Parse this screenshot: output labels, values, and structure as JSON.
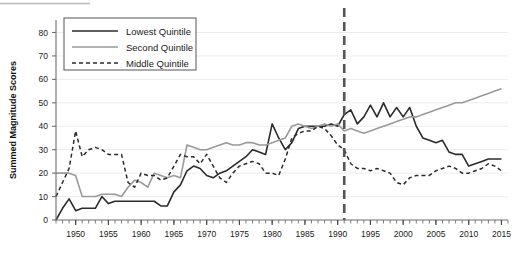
{
  "chart_data": {
    "type": "line",
    "title": "",
    "xlabel": "",
    "ylabel": "Summed Magnitude Scores",
    "xlim": [
      1947,
      2016
    ],
    "ylim": [
      0,
      85
    ],
    "grid": true,
    "grid_axis": "y",
    "legend_position": "top-left",
    "y_ticks": [
      0,
      10,
      20,
      30,
      40,
      50,
      60,
      70,
      80
    ],
    "y_tick_labels": [
      "0",
      "10",
      "20",
      "30",
      "40",
      "50",
      "60",
      "70",
      "80"
    ],
    "x_ticks": [
      1950,
      1955,
      1960,
      1965,
      1970,
      1975,
      1980,
      1985,
      1990,
      1995,
      2000,
      2005,
      2010,
      2015
    ],
    "x_tick_labels": [
      "1950",
      "1955",
      "1960",
      "1965",
      "1970",
      "1975",
      "1980",
      "1985",
      "1990",
      "1995",
      "2000",
      "2005",
      "2010",
      "2015"
    ],
    "x_minor_tick_step": 1,
    "annotations": [
      {
        "name": "vertical-reference-line",
        "type": "vline",
        "x": 1991,
        "style": "dashed",
        "color": "#555555",
        "width": 2.6
      }
    ],
    "x": [
      1947,
      1948,
      1949,
      1950,
      1951,
      1952,
      1953,
      1954,
      1955,
      1956,
      1957,
      1958,
      1959,
      1960,
      1961,
      1962,
      1963,
      1964,
      1965,
      1966,
      1967,
      1968,
      1969,
      1970,
      1971,
      1972,
      1973,
      1974,
      1975,
      1976,
      1977,
      1978,
      1979,
      1980,
      1981,
      1982,
      1983,
      1984,
      1985,
      1986,
      1987,
      1988,
      1989,
      1990,
      1991,
      1992,
      1993,
      1994,
      1995,
      1996,
      1997,
      1998,
      1999,
      2000,
      2001,
      2002,
      2003,
      2004,
      2005,
      2006,
      2007,
      2008,
      2009,
      2010,
      2011,
      2012,
      2013,
      2014,
      2015
    ],
    "series": [
      {
        "name": "Lowest Quintile",
        "color": "#2b2b2b",
        "linestyle": "solid",
        "linewidth": 1.6,
        "values": [
          0,
          5,
          9,
          4,
          5,
          5,
          5,
          10,
          7,
          8,
          8,
          8,
          8,
          8,
          8,
          8,
          6,
          6,
          12,
          15,
          21,
          23,
          22,
          19,
          18,
          20,
          21,
          23,
          25,
          27,
          30,
          29,
          28,
          41,
          35,
          30,
          33,
          39,
          40,
          40,
          40,
          40,
          41,
          40,
          45,
          47,
          41,
          44,
          49,
          44,
          50,
          44,
          48,
          44,
          48,
          40,
          35,
          34,
          33,
          34,
          29,
          28,
          28,
          23,
          24,
          25,
          26,
          26,
          26
        ]
      },
      {
        "name": "Second Quintile",
        "color": "#9a9a9a",
        "linestyle": "solid",
        "linewidth": 1.6,
        "values": [
          20,
          20,
          20,
          19,
          10,
          10,
          10,
          11,
          11,
          11,
          10,
          14,
          17,
          16,
          14,
          20,
          19,
          18,
          19,
          18,
          32,
          31,
          30,
          30,
          31,
          32,
          33,
          32,
          32,
          33,
          33,
          32,
          32,
          33,
          34,
          35,
          40,
          41,
          40,
          39,
          40,
          41,
          40,
          41,
          38,
          39,
          38,
          37,
          38,
          39,
          40,
          41,
          42,
          43,
          44,
          44,
          45,
          46,
          47,
          48,
          49,
          50,
          50,
          51,
          52,
          53,
          54,
          55,
          56
        ]
      },
      {
        "name": "Middle Quintile",
        "color": "#2b2b2b",
        "linestyle": "dashed",
        "linewidth": 1.5,
        "values": [
          10,
          16,
          22,
          38,
          27,
          30,
          31,
          30,
          28,
          28,
          28,
          16,
          14,
          20,
          19,
          19,
          17,
          18,
          23,
          28,
          27,
          27,
          24,
          28,
          23,
          18,
          16,
          20,
          23,
          24,
          25,
          24,
          20,
          20,
          19,
          26,
          35,
          37,
          38,
          38,
          40,
          39,
          36,
          32,
          30,
          24,
          22,
          22,
          21,
          22,
          21,
          20,
          16,
          15,
          18,
          19,
          19,
          19,
          21,
          22,
          23,
          22,
          20,
          20,
          21,
          22,
          24,
          23,
          21
        ]
      }
    ]
  },
  "legend": {
    "entries": [
      {
        "label": "Lowest Quintile"
      },
      {
        "label": "Second Quintile"
      },
      {
        "label": "Middle Quintile"
      }
    ]
  },
  "axes": {
    "y_title": "Summed Magnitude Scores"
  }
}
